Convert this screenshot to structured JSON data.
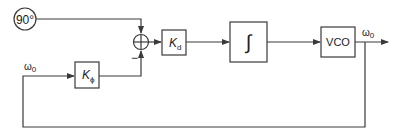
{
  "diagram": {
    "type": "block-diagram",
    "blocks": {
      "phase_ref": {
        "label": "90°",
        "shape": "circle"
      },
      "summer": {
        "shape": "summing-junction",
        "minus_sign": "−"
      },
      "kd": {
        "label": "K",
        "sub": "d"
      },
      "integrator": {
        "label": "∫"
      },
      "vco": {
        "label": "VCO"
      },
      "kphi": {
        "label": "K",
        "sub": "ϕ"
      }
    },
    "signals": {
      "output": {
        "label": "ω",
        "sub": "0"
      },
      "feedback": {
        "label": "ω",
        "sub": "0"
      }
    },
    "connections": [
      {
        "from": "phase_ref",
        "to": "summer",
        "sign": "+"
      },
      {
        "from": "kphi",
        "to": "summer",
        "sign": "−"
      },
      {
        "from": "summer",
        "to": "kd"
      },
      {
        "from": "kd",
        "to": "integrator"
      },
      {
        "from": "integrator",
        "to": "vco"
      },
      {
        "from": "vco",
        "to": "output"
      },
      {
        "from": "output",
        "to": "kphi",
        "type": "feedback"
      }
    ]
  },
  "colors": {
    "stroke": "#3a3a3a",
    "background": "#ffffff"
  }
}
